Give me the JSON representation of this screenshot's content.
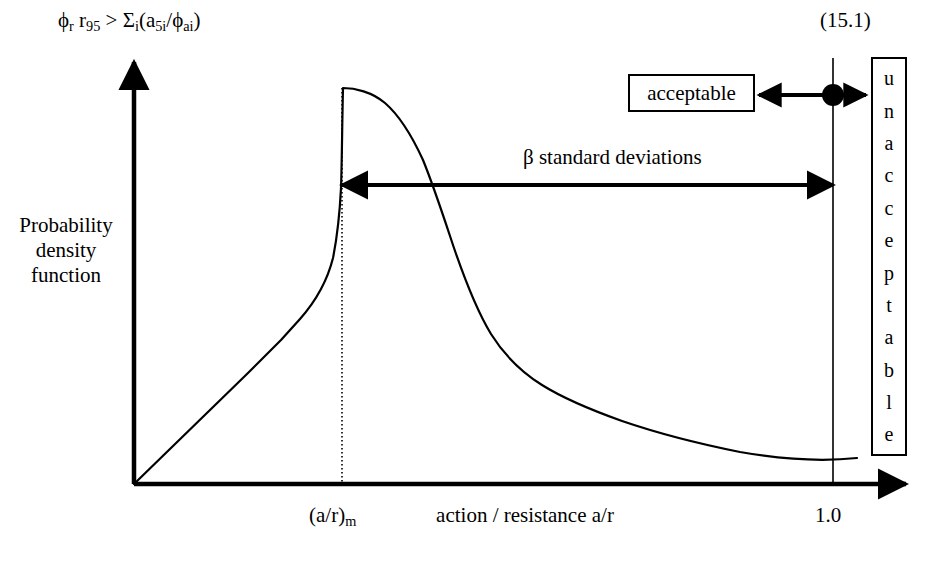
{
  "figure": {
    "equation_number": "(15.1)",
    "formula": {
      "phi_r": "ϕ",
      "phi_r_sub": "r",
      "r95": "r",
      "r95_sub": "95",
      "relation": ">",
      "sigma": "Σ",
      "sigma_sub": "i",
      "open_paren": "(",
      "a5i": "a",
      "a5i_sub": "5i",
      "slash": "/",
      "phi_ai": "ϕ",
      "phi_ai_sub": "ai",
      "close_paren": ")"
    },
    "y_axis_label": "Probability density function",
    "x_axis_label": "action / resistance a/r",
    "x_tick_mode": "(a/r)",
    "x_tick_mode_sub": "m",
    "x_tick_one": "1.0",
    "beta_annotation": "β standard deviations",
    "acceptable_label": "acceptable",
    "unacceptable_letters": [
      "u",
      "n",
      "a",
      "c",
      "c",
      "e",
      "p",
      "t",
      "a",
      "b",
      "l",
      "e"
    ],
    "colors": {
      "line": "#000000",
      "background": "#ffffff",
      "marker": "#000000"
    }
  },
  "chart_data": {
    "type": "line",
    "title": "",
    "xlabel": "action / resistance a/r",
    "ylabel": "Probability density function",
    "xlim": [
      0,
      1.18
    ],
    "ylim": [
      0,
      1.05
    ],
    "grid": false,
    "legend": null,
    "annotations": [
      {
        "name": "mode-line",
        "type": "vline",
        "x": 0.295,
        "style": "dotted",
        "label": "(a/r)m"
      },
      {
        "name": "unity-line",
        "type": "vline",
        "x": 1.0,
        "style": "solid",
        "label": "1.0"
      },
      {
        "name": "beta-arrow",
        "type": "double-arrow",
        "x_start": 0.295,
        "x_end": 1.0,
        "y": 0.755,
        "label": "β standard deviations"
      },
      {
        "name": "acceptable-unacceptable-arrow",
        "type": "double-arrow",
        "x_start": 0.855,
        "x_end": 1.1,
        "y": 0.91,
        "label_left": "acceptable",
        "label_right": "unacceptable"
      },
      {
        "name": "unity-marker",
        "type": "point",
        "x": 1.0,
        "y": 0.91
      }
    ],
    "series": [
      {
        "name": "probability density function",
        "x": [
          0.0,
          0.03,
          0.06,
          0.09,
          0.12,
          0.15,
          0.18,
          0.205,
          0.23,
          0.255,
          0.275,
          0.295,
          0.315,
          0.335,
          0.355,
          0.375,
          0.4,
          0.425,
          0.45,
          0.475,
          0.5,
          0.53,
          0.56,
          0.6,
          0.64,
          0.68,
          0.72,
          0.77,
          0.82,
          0.87,
          0.92,
          0.97,
          1.0,
          1.03
        ],
        "y": [
          0.0,
          0.094,
          0.188,
          0.282,
          0.376,
          0.47,
          0.564,
          0.645,
          0.724,
          0.804,
          0.869,
          0.928,
          0.932,
          0.926,
          0.912,
          0.888,
          0.845,
          0.788,
          0.716,
          0.636,
          0.556,
          0.468,
          0.398,
          0.327,
          0.276,
          0.238,
          0.208,
          0.176,
          0.15,
          0.127,
          0.107,
          0.088,
          0.078,
          0.064
        ]
      }
    ]
  }
}
